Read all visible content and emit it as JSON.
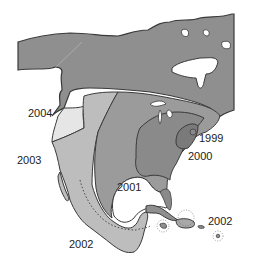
{
  "map": {
    "region": "North America",
    "style": "grayscale",
    "colors": {
      "background": "#ffffff",
      "land_unaffected": "#8f8f8f",
      "zone_1999": "#7a7a7a",
      "zone_2000": "#8c8c8c",
      "zone_2001": "#9b9b9b",
      "zone_2002": "#bdbdbd",
      "zone_2003": "#e6e6e6",
      "zone_2004": "#8f8f8f",
      "outline": "#3a3a3a",
      "water": "#ffffff"
    },
    "labels": [
      {
        "id": "label-2004",
        "text": "2004"
      },
      {
        "id": "label-2003",
        "text": "2003"
      },
      {
        "id": "label-1999",
        "text": "1999"
      },
      {
        "id": "label-2000",
        "text": "2000"
      },
      {
        "id": "label-2001",
        "text": "2001"
      },
      {
        "id": "label-2002-mexico",
        "text": "2002"
      },
      {
        "id": "label-2002-caribbean",
        "text": "2002"
      }
    ]
  }
}
